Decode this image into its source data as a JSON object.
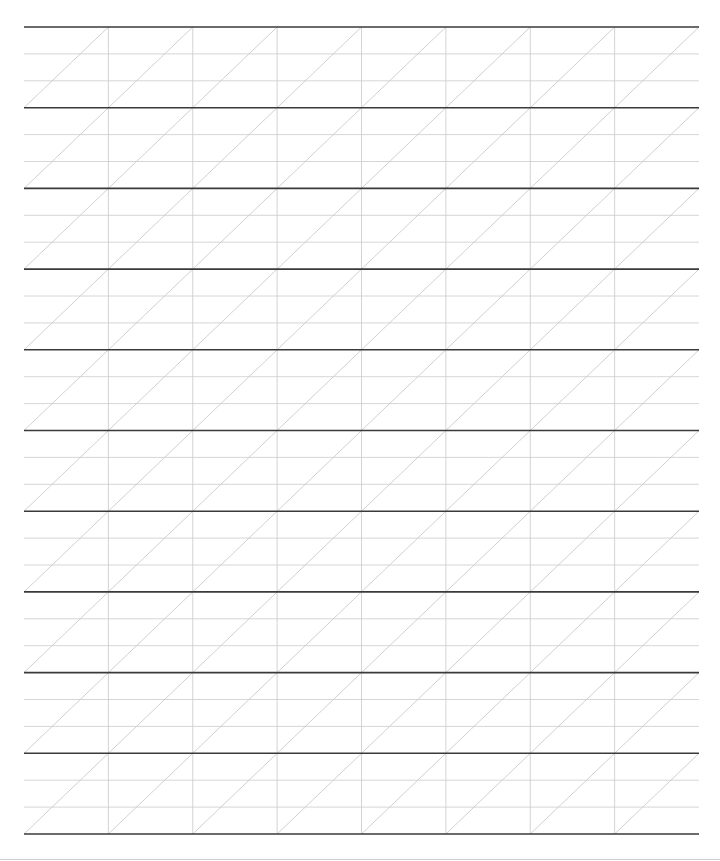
{
  "sheet": {
    "type": "handwriting-practice-sheet",
    "grid": {
      "left": 24,
      "right": 699,
      "top": 27,
      "band_height": 80.7,
      "band_count": 10,
      "column_count": 8,
      "guides_per_band": 2
    },
    "colors": {
      "background": "#ffffff",
      "baseline": "#3a3a3a",
      "guide": "#cccccc",
      "column": "#c8c8c8",
      "slant": "#c4c4c4",
      "page_border": "#cfcfcf"
    },
    "stroke_widths": {
      "baseline": 1.6,
      "guide": 0.8,
      "column": 0.8,
      "slant": 0.8
    }
  }
}
